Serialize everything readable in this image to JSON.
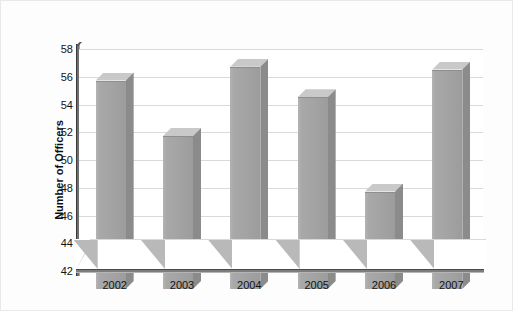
{
  "chart_data": {
    "type": "bar",
    "title": "",
    "xlabel": "",
    "ylabel": "Number of Officers",
    "categories": [
      "2002",
      "2003",
      "2004",
      "2005",
      "2006",
      "2007"
    ],
    "values": [
      56.3,
      52.3,
      57.3,
      55.1,
      48.3,
      57.1
    ],
    "ylim": [
      42,
      58
    ],
    "yticks": [
      42,
      44,
      46,
      48,
      50,
      52,
      54,
      56,
      58
    ],
    "ytick_labels": [
      "42",
      "44",
      "46",
      "48",
      "50",
      "52",
      "54",
      "56",
      "58"
    ],
    "grid": true,
    "legend": "none",
    "series": [
      {
        "name": "Number of Officers",
        "values": [
          56.3,
          52.3,
          57.3,
          55.1,
          48.3,
          57.1
        ]
      }
    ],
    "style": "3d-column",
    "bar_color": "#a3a3a3",
    "bar_top_color": "#c9c9c9",
    "bar_side_color": "#8b8b8b",
    "grid_color": "#d9d9d9",
    "axis_color": "#4a4a4a",
    "background": "#ffffff"
  },
  "axis": {
    "y_title": "Number of Officers"
  }
}
